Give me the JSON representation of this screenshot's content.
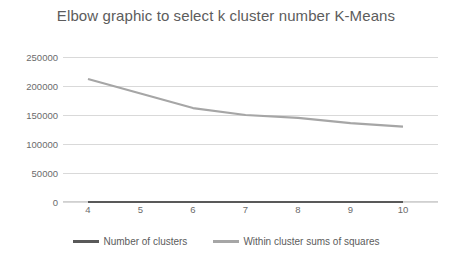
{
  "chart_data": {
    "type": "line",
    "title": "Elbow graphic to select k cluster number K-Means",
    "xlabel": "",
    "ylabel": "",
    "categories": [
      4,
      5,
      6,
      7,
      8,
      9,
      10
    ],
    "x_tick_labels": [
      "4",
      "5",
      "6",
      "7",
      "8",
      "9",
      "10"
    ],
    "y_tick_labels": [
      "250000",
      "200000",
      "150000",
      "100000",
      "50000",
      "0"
    ],
    "y_ticks": [
      250000,
      200000,
      150000,
      100000,
      50000,
      0
    ],
    "ylim": [
      0,
      250000
    ],
    "grid": true,
    "legend_position": "bottom-center",
    "series": [
      {
        "name": "Number of clusters",
        "color": "#595959",
        "values": [
          0,
          0,
          0,
          0,
          0,
          0,
          0
        ]
      },
      {
        "name": "Within cluster sums of squares",
        "color": "#a6a6a6",
        "values": [
          212000,
          187000,
          162000,
          150000,
          145000,
          136000,
          130000
        ]
      }
    ]
  },
  "colors": {
    "title": "#5c5c5c",
    "tick_label": "#6b6b6b",
    "gridline": "#d9d9d9",
    "series_dark": "#595959",
    "series_light": "#a6a6a6",
    "background": "#ffffff"
  }
}
